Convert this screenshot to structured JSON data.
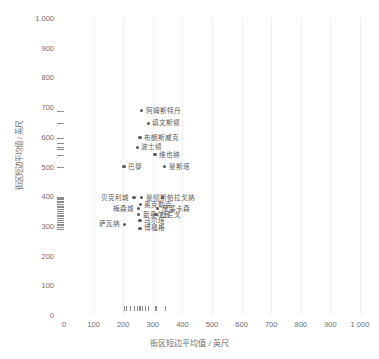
{
  "chart_data": {
    "type": "scatter",
    "title": "",
    "xlabel": "街区短边平均值 / 英尺",
    "ylabel": "街区短边平均值 / 英尺",
    "xlim": [
      0,
      1000
    ],
    "ylim": [
      0,
      1000
    ],
    "xticks": [
      "0",
      "100",
      "200",
      "300",
      "400",
      "500",
      "600",
      "700",
      "800",
      "900",
      "1 000"
    ],
    "xtick_values": [
      0,
      100,
      200,
      300,
      400,
      500,
      600,
      700,
      800,
      900,
      1000
    ],
    "yticks": [
      "0",
      "100",
      "200",
      "300",
      "400",
      "500",
      "600",
      "700",
      "800",
      "900",
      "1 000"
    ],
    "ytick_values": [
      0,
      100,
      200,
      300,
      400,
      500,
      600,
      700,
      800,
      900,
      1000
    ],
    "grid": "vertical-faint",
    "legend": "none",
    "points": [
      {
        "label": "阿姆斯特丹",
        "x": 262,
        "y": 688,
        "side": "right"
      },
      {
        "label": "填文斯顿",
        "x": 285,
        "y": 645,
        "side": "right"
      },
      {
        "label": "布朗斯威克",
        "x": 257,
        "y": 597,
        "side": "right"
      },
      {
        "label": "波士顿",
        "x": 248,
        "y": 565,
        "side": "right"
      },
      {
        "label": "维也纳",
        "x": 307,
        "y": 540,
        "side": "right"
      },
      {
        "label": "巴黎",
        "x": 203,
        "y": 500,
        "side": "right"
      },
      {
        "label": "曼斯塔",
        "x": 340,
        "y": 500,
        "side": "right"
      },
      {
        "label": "贝克利城",
        "x": 236,
        "y": 395,
        "side": "left"
      },
      {
        "label": "曼彻斯",
        "x": 262,
        "y": 395,
        "side": "right"
      },
      {
        "label": "帕拉戈纳",
        "x": 333,
        "y": 395,
        "side": "right"
      },
      {
        "label": "奥克勒克",
        "x": 258,
        "y": 372,
        "side": "right"
      },
      {
        "label": "梅森城",
        "x": 252,
        "y": 358,
        "side": "left"
      },
      {
        "label": "摩塞卡森",
        "x": 316,
        "y": 358,
        "side": "right"
      },
      {
        "label": "新奥尔良",
        "x": 252,
        "y": 338,
        "side": "right"
      },
      {
        "label": "杜兰戈",
        "x": 311,
        "y": 338,
        "side": "right"
      },
      {
        "label": "马尔塔",
        "x": 257,
        "y": 318,
        "side": "right"
      },
      {
        "label": "萨瓦纳",
        "x": 205,
        "y": 305,
        "side": "left"
      },
      {
        "label": "博福格",
        "x": 257,
        "y": 292,
        "side": "right"
      }
    ],
    "y_rug_values": [
      688,
      645,
      597,
      580,
      565,
      560,
      540,
      500,
      398,
      395,
      390,
      385,
      380,
      374,
      368,
      362,
      356,
      350,
      344,
      338,
      332,
      326,
      320,
      314,
      308,
      302,
      296,
      290
    ],
    "x_rug_values": [
      203,
      210,
      222,
      236,
      248,
      252,
      257,
      262,
      272,
      285,
      307,
      311,
      340
    ]
  }
}
